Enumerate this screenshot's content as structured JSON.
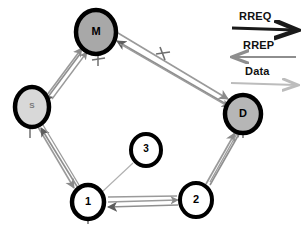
{
  "diagram": {
    "nodes": [
      {
        "id": "M",
        "label": "M",
        "x": 96,
        "y": 32,
        "rx": 22,
        "ry": 23,
        "fill": "#a8a8a8",
        "stroke": "#000000",
        "stroke_width": 4.5,
        "font_size": 11
      },
      {
        "id": "S",
        "label": "S",
        "x": 32,
        "y": 107,
        "rx": 19,
        "ry": 21,
        "fill": "#d8d8d8",
        "stroke": "#000000",
        "stroke_width": 4.5,
        "font_size": 8
      },
      {
        "id": "D",
        "label": "D",
        "x": 243,
        "y": 114,
        "rx": 20,
        "ry": 21,
        "fill": "#b6b6b6",
        "stroke": "#000000",
        "stroke_width": 4.5,
        "font_size": 11
      },
      {
        "id": "N1",
        "label": "1",
        "x": 88,
        "y": 202,
        "rx": 18,
        "ry": 19,
        "fill": "#ffffff",
        "stroke": "#000000",
        "stroke_width": 4.5,
        "font_size": 11
      },
      {
        "id": "N2",
        "label": "2",
        "x": 196,
        "y": 200,
        "rx": 18,
        "ry": 19,
        "fill": "#ffffff",
        "stroke": "#000000",
        "stroke_width": 4.0,
        "font_size": 11
      },
      {
        "id": "N3",
        "label": "3",
        "x": 146,
        "y": 150,
        "rx": 17,
        "ry": 18,
        "fill": "#ffffff",
        "stroke": "#000000",
        "stroke_width": 4.0,
        "font_size": 10
      }
    ],
    "links": [
      {
        "from": "S",
        "to": "M",
        "kind": "double",
        "name": "link-s-m"
      },
      {
        "from": "M",
        "to": "D",
        "kind": "double",
        "name": "link-m-d"
      },
      {
        "from": "S",
        "to": "N1",
        "kind": "double",
        "name": "link-s-1"
      },
      {
        "from": "N1",
        "to": "N2",
        "kind": "double",
        "name": "link-1-2"
      },
      {
        "from": "N2",
        "to": "D",
        "kind": "double",
        "name": "link-2-d"
      },
      {
        "from": "N3",
        "to": "N1",
        "kind": "thin",
        "name": "link-3-1"
      }
    ],
    "colors": {
      "rreq": "#1a1a1a",
      "rrep": "#8e8e8e",
      "data": "#b9b9b9",
      "edge": "#9a9a9a",
      "edge_dark": "#6f6f6f",
      "node_border": "#000000"
    }
  },
  "legend": {
    "items": [
      {
        "label": "RREQ",
        "direction": "right",
        "color": "#1a1a1a",
        "thickness": 3.0
      },
      {
        "label": "RREP",
        "direction": "left",
        "color": "#8e8e8e",
        "thickness": 2.2
      },
      {
        "label": "Data",
        "direction": "right",
        "color": "#bcbcbc",
        "thickness": 2.0
      }
    ]
  }
}
